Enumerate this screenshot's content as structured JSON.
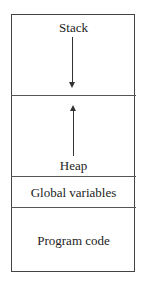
{
  "diagram": {
    "segments": [
      {
        "label": "Stack",
        "arrow": "down"
      },
      {
        "label": "Heap",
        "arrow": "up"
      },
      {
        "label": "Global variables"
      },
      {
        "label": "Program code"
      }
    ]
  }
}
